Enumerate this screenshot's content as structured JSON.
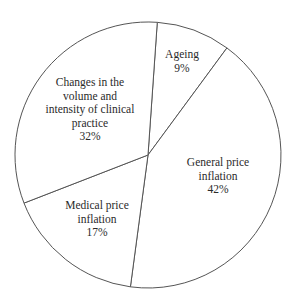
{
  "chart_data": {
    "type": "pie",
    "title": "",
    "start_angle_deg": 4,
    "direction": "clockwise",
    "slices": [
      {
        "label": "Ageing",
        "value": 9,
        "display": "9%"
      },
      {
        "label": "General price inflation",
        "value": 42,
        "display": "42%"
      },
      {
        "label": "Medical price inflation",
        "value": 17,
        "display": "17%"
      },
      {
        "label": "Changes in the volume and intensity of clinical practice",
        "value": 32,
        "display": "32%"
      }
    ],
    "legend": "none",
    "colors": {
      "fill": "#ffffff",
      "stroke": "#555555",
      "text": "#2a2a2a"
    }
  },
  "labels": [
    {
      "lines": [
        "Ageing",
        "9%"
      ],
      "x": 182,
      "y": 62
    },
    {
      "lines": [
        "General price",
        "inflation",
        "42%"
      ],
      "x": 218,
      "y": 176
    },
    {
      "lines": [
        "Medical price",
        "inflation",
        "17%"
      ],
      "x": 97,
      "y": 219
    },
    {
      "lines": [
        "Changes in the",
        "volume and",
        "intensity of clinical",
        "practice",
        "32%"
      ],
      "x": 90,
      "y": 110
    }
  ]
}
